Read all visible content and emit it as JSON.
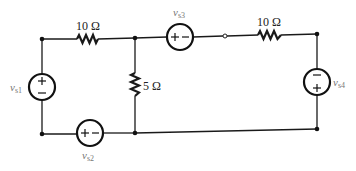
{
  "diagram": {
    "type": "circuit-schematic",
    "resistors": [
      {
        "id": "R1",
        "label": "10 Ω",
        "position": "top-left branch",
        "orientation": "horizontal"
      },
      {
        "id": "R2",
        "label": "5 Ω",
        "position": "middle vertical branch",
        "orientation": "vertical"
      },
      {
        "id": "R3",
        "label": "10 Ω",
        "position": "top-right branch",
        "orientation": "horizontal"
      }
    ],
    "sources": [
      {
        "id": "vs1",
        "symbol": "v",
        "subscript": "s1",
        "polarity_top": "+",
        "polarity_bottom": "−",
        "position": "left vertical branch"
      },
      {
        "id": "vs2",
        "symbol": "v",
        "subscript": "s2",
        "polarity_left": "+",
        "polarity_right": "−",
        "position": "bottom-left horizontal branch"
      },
      {
        "id": "vs3",
        "symbol": "v",
        "subscript": "s3",
        "polarity_left": "+",
        "polarity_right": "−",
        "position": "top-middle horizontal branch"
      },
      {
        "id": "vs4",
        "symbol": "v",
        "subscript": "s4",
        "polarity_top": "−",
        "polarity_bottom": "+",
        "position": "right vertical branch"
      }
    ],
    "nodes": [
      "top-left",
      "top-middle",
      "top-right",
      "bottom-left",
      "bottom-middle",
      "bottom-right"
    ],
    "open_terminal": "between vs3 and right 10 Ω resistor"
  },
  "labels": {
    "r1": "10 Ω",
    "r2": "5 Ω",
    "r3": "10 Ω",
    "vs1": {
      "v": "v",
      "sub": "s1"
    },
    "vs2": {
      "v": "v",
      "sub": "s2"
    },
    "vs3": {
      "v": "v",
      "sub": "s3"
    },
    "vs4": {
      "v": "v",
      "sub": "s4"
    }
  },
  "signs": {
    "plus": "+",
    "minus": "−"
  }
}
